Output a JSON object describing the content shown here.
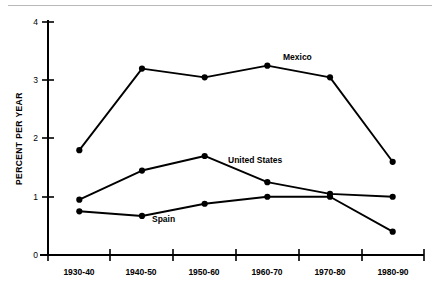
{
  "chart_data": {
    "type": "line",
    "title": "",
    "xlabel": "",
    "ylabel": "PERCENT PER YEAR",
    "categories": [
      "1930-40",
      "1940-50",
      "1950-60",
      "1960-70",
      "1970-80",
      "1980-90"
    ],
    "ylim": [
      0,
      4
    ],
    "yticks": [
      0,
      1,
      2,
      3,
      4
    ],
    "ytick_labels": [
      "0",
      "1",
      "2",
      "3",
      "4"
    ],
    "grid": false,
    "legend": "inline-annotations",
    "series": [
      {
        "name": "Mexico",
        "values": [
          1.8,
          3.2,
          3.05,
          3.25,
          3.05,
          1.6
        ],
        "marker": "filled-circle",
        "color": "#000000",
        "label_x": "1960-70",
        "label_text": "Mexico"
      },
      {
        "name": "United States",
        "values": [
          0.95,
          1.45,
          1.7,
          1.25,
          1.05,
          1.0
        ],
        "marker": "filled-circle",
        "color": "#000000",
        "label_x": "1950-60",
        "label_text": "United States"
      },
      {
        "name": "Spain",
        "values": [
          0.75,
          0.67,
          0.88,
          1.0,
          1.0,
          0.4
        ],
        "marker": "filled-circle",
        "color": "#000000",
        "label_x": "1940-50",
        "label_text": "Spain"
      }
    ]
  },
  "labels": {
    "y_axis_title": "PERCENT PER YEAR",
    "mexico": "Mexico",
    "united_states": "United States",
    "spain": "Spain",
    "y0": "0",
    "y1": "1",
    "y2": "2",
    "y3": "3",
    "y4": "4",
    "x0": "1930-40",
    "x1": "1940-50",
    "x2": "1950-60",
    "x3": "1960-70",
    "x4": "1970-80",
    "x5": "1980-90"
  }
}
